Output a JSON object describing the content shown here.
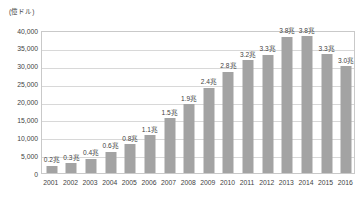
{
  "chart_data": {
    "type": "bar",
    "title": "",
    "subtitle": "",
    "xlabel": "",
    "ylabel": "(億ドル)",
    "ylim": [
      0,
      40000
    ],
    "ytick_labels": [
      "40,000",
      "35,000",
      "30,000",
      "25,000",
      "20,000",
      "15,000",
      "10,000",
      "5,000",
      "0"
    ],
    "ytick_values": [
      40000,
      35000,
      30000,
      25000,
      20000,
      15000,
      10000,
      5000,
      0
    ],
    "grid": true,
    "legend": "none",
    "categories": [
      "2001",
      "2002",
      "2003",
      "2004",
      "2005",
      "2006",
      "2007",
      "2008",
      "2009",
      "2010",
      "2011",
      "2012",
      "2013",
      "2014",
      "2015",
      "2016"
    ],
    "values": [
      2000,
      2700,
      4000,
      6000,
      8000,
      10500,
      15300,
      19300,
      23900,
      28300,
      31600,
      33100,
      38100,
      38200,
      33200,
      29900
    ],
    "data_labels": [
      "0.2兆",
      "0.3兆",
      "0.4兆",
      "0.6兆",
      "0.8兆",
      "1.1兆",
      "1.5兆",
      "1.9兆",
      "2.4兆",
      "2.8兆",
      "3.2兆",
      "3.3兆",
      "3.8兆",
      "3.8兆",
      "3.3兆",
      "3.0兆"
    ],
    "series_name": "",
    "bar_color": "#a3a3a3",
    "grid_color": "#d8d8d8",
    "frame_color": "#c9c9c9",
    "text_color": "#3f3f3f"
  }
}
